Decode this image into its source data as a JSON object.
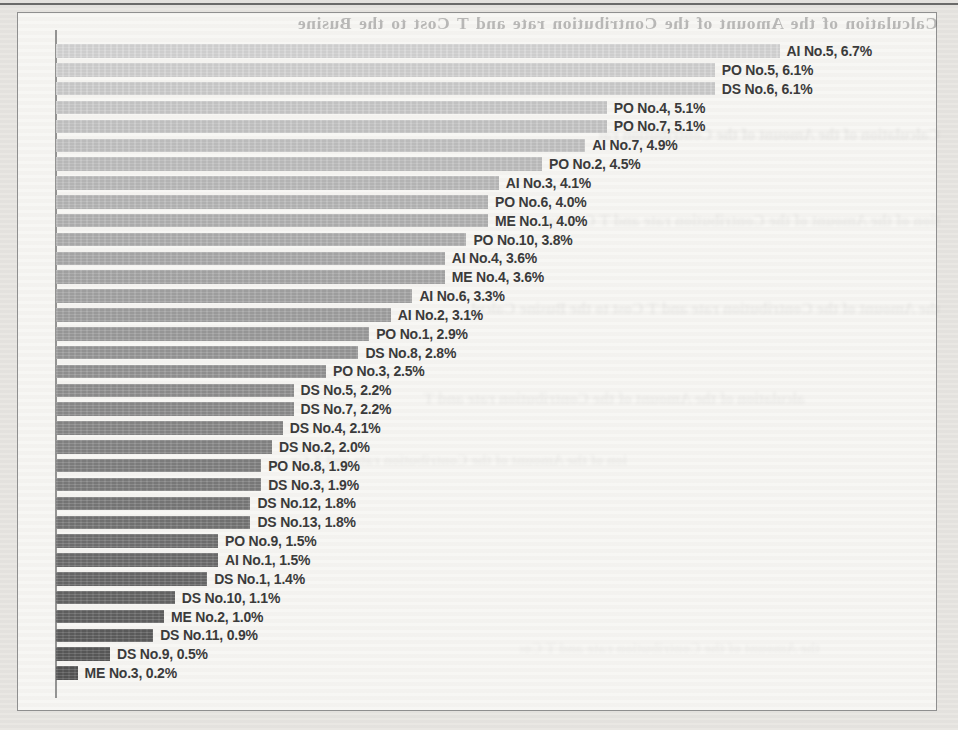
{
  "page": {
    "bleed_through_text": "Calculation of the Amount of the Contribution rate and T Cost to the Busine"
  },
  "chart_data": {
    "type": "bar",
    "orientation": "horizontal",
    "title": "",
    "xlabel": "",
    "ylabel": "",
    "xlim": [
      0,
      7
    ],
    "grid": false,
    "legend": false,
    "data_label_format": "{category}, {value}%",
    "categories": [
      "AI No.5",
      "PO No.5",
      "DS No.6",
      "PO No.4",
      "PO No.7",
      "AI No.7",
      "PO No.2",
      "AI No.3",
      "PO No.6",
      "ME No.1",
      "PO No.10",
      "AI No.4",
      "ME No.4",
      "AI No.6",
      "AI No.2",
      "PO No.1",
      "DS No.8",
      "PO No.3",
      "DS No.5",
      "DS No.7",
      "DS No.4",
      "DS No.2",
      "PO No.8",
      "DS No.3",
      "DS No.12",
      "DS No.13",
      "PO No.9",
      "AI No.1",
      "DS No.1",
      "DS No.10",
      "ME No.2",
      "DS No.11",
      "DS No.9",
      "ME No.3"
    ],
    "values": [
      6.7,
      6.1,
      6.1,
      5.1,
      5.1,
      4.9,
      4.5,
      4.1,
      4.0,
      4.0,
      3.8,
      3.6,
      3.6,
      3.3,
      3.1,
      2.9,
      2.8,
      2.5,
      2.2,
      2.2,
      2.1,
      2.0,
      1.9,
      1.9,
      1.8,
      1.8,
      1.5,
      1.5,
      1.4,
      1.1,
      1.0,
      0.9,
      0.5,
      0.2
    ],
    "style": {
      "bar_color_start": "#d5d5d5",
      "bar_color_end": "#555555",
      "label_color": "#3b3b3b",
      "frame_border_color": "#8f8f8f",
      "paper_color": "#e8e6e2",
      "chart_bg_color": "#f7f6f3",
      "axis_color": "#7a7a7a"
    }
  }
}
